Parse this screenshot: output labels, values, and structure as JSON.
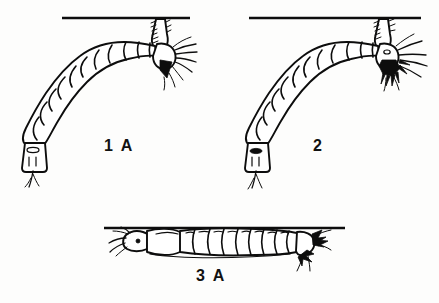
{
  "plate": {
    "title": "Mosquito larvae at the water surface",
    "background_color": "#fdfdfc",
    "ink_color": "#0d0d0d",
    "width": 439,
    "height": 303
  },
  "figures": [
    {
      "id": "figure-1a",
      "label": "1 A",
      "label_position": {
        "x": 104,
        "y": 137
      },
      "orientation": "hanging head-down from water surface, body curved to lower left",
      "posture_angle_deg": 45,
      "segment_count": 11,
      "attaches_to_surface_at": {
        "x": 163,
        "y": 18
      },
      "features": [
        "air-tube siphon contacting surface film",
        "dark triangular mouth-brush mass",
        "radiating head setae",
        "anal segment with pale oval saddle",
        "two fine caudal setae"
      ]
    },
    {
      "id": "figure-2",
      "label": "2",
      "label_position": {
        "x": 313,
        "y": 137
      },
      "orientation": "hanging head-down from water surface, body curved to lower left",
      "posture_angle_deg": 45,
      "segment_count": 11,
      "attaches_to_surface_at": {
        "x": 385,
        "y": 18
      },
      "features": [
        "short air-tube siphon at surface film",
        "dense black mouth-brush tufts",
        "long sweeping head setae",
        "anal segment with solid dark spiracular mark",
        "two fine caudal setae"
      ]
    },
    {
      "id": "figure-3a",
      "label": "3 A",
      "label_position": {
        "x": 196,
        "y": 267
      },
      "orientation": "lying horizontally parallel beneath the water surface",
      "posture_angle_deg": 0,
      "segment_count": 10,
      "attaches_to_surface_at": {
        "x": 300,
        "y": 228
      },
      "features": [
        "head with eye spot and forward mouth brushes",
        "enlarged thorax",
        "eight narrow abdominal segments with dorsal arc marks",
        "no elongate siphon, body flush with surface",
        "black posterior bristle tufts"
      ]
    }
  ],
  "surface_lines": [
    {
      "id": "surface-line-1",
      "x1": 62,
      "y1": 18,
      "x2": 190,
      "y2": 18
    },
    {
      "id": "surface-line-2",
      "x1": 249,
      "y1": 18,
      "x2": 421,
      "y2": 18
    },
    {
      "id": "surface-line-3",
      "x1": 104,
      "y1": 228,
      "x2": 345,
      "y2": 228
    }
  ]
}
